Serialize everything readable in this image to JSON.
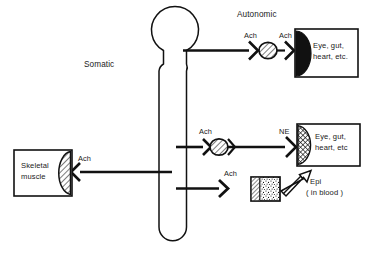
{
  "figure": {
    "type": "diagram",
    "background_color": "#ffffff",
    "line_color": "#111111",
    "text_color": "#1a1a1a"
  },
  "sections": {
    "somatic_label": "Somatic",
    "autonomic_label": "Autonomic"
  },
  "cns": {
    "name": "central-nervous-system",
    "brain_label": "",
    "cord_label": ""
  },
  "pathways": [
    {
      "id": "somatic",
      "division": "Somatic",
      "neurotransmitter": "Ach",
      "target_label": "Skeletal\nmuscle",
      "target_line1": "Skeletal",
      "target_line2": "muscle",
      "receptor_fill": "diagonal-hatch",
      "ganglion": false
    },
    {
      "id": "autonomic-parasympathetic",
      "division": "Autonomic",
      "preganglionic_transmitter": "Ach",
      "postganglionic_transmitter": "Ach",
      "target_line1": "Eye, gut,",
      "target_line2": "heart, etc.",
      "receptor_fill": "solid-black",
      "ganglion": true
    },
    {
      "id": "autonomic-sympathetic",
      "division": "Autonomic",
      "preganglionic_transmitter": "Ach",
      "postganglionic_transmitter": "NE",
      "target_line1": "Eye, gut,",
      "target_line2": "heart, etc",
      "receptor_fill": "cross-hatch",
      "ganglion": true
    },
    {
      "id": "autonomic-adrenal",
      "division": "Autonomic",
      "preganglionic_transmitter": "Ach",
      "target_line1": "Epi",
      "target_line2": "( in blood )",
      "organ_fill": "stipple",
      "ganglion": false
    }
  ],
  "labels": {
    "ach_top_pre": "Ach",
    "ach_top_post": "Ach",
    "ach_mid_pre": "Ach",
    "ne_mid_post": "NE",
    "ach_bottom": "Ach",
    "ach_somatic": "Ach",
    "organ_top_line1": "Eye, gut,",
    "organ_top_line2": "heart, etc.",
    "organ_mid_line1": "Eye, gut,",
    "organ_mid_line2": "heart, etc",
    "muscle_line1": "Skeletal",
    "muscle_line2": "muscle",
    "epi_line1": "Epi",
    "epi_line2": "( in blood )"
  }
}
